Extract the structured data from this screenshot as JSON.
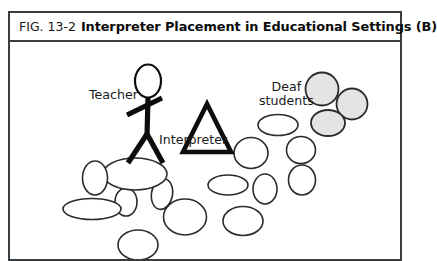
{
  "figure": {
    "number": "FIG. 13-2",
    "title": "Interpreter Placement in Educational Settings (B)",
    "frame_color": "#3a3d3f"
  },
  "diagram": {
    "labels": {
      "teacher": "Teacher",
      "interpreter": "Interpreter",
      "deaf_students_line1": "Deaf",
      "deaf_students_line2": "students"
    },
    "icons": {
      "teacher": "stick-figure-icon",
      "interpreter": "triangle-icon",
      "student": "ellipse-icon",
      "deaf_student": "shaded-circle-icon"
    },
    "colors": {
      "outline": "#2b2b2b",
      "student_fill": "#ffffff",
      "deaf_student_fill": "#e4e4e4",
      "figure_stroke": "#0d0d0d"
    },
    "shapes": {
      "teacher_figure": {
        "head_cx": 138,
        "head_cy": 39,
        "head_rx": 13,
        "head_ry": 16.5
      },
      "interpreter_triangle": {
        "apex_x": 197,
        "apex_y": 62,
        "left_x": 173,
        "right_y": 110,
        "right_x": 221
      },
      "deaf_students": [
        {
          "cx": 312,
          "cy": 47,
          "r": 16.5
        },
        {
          "cx": 342,
          "cy": 62,
          "r": 15.5
        },
        {
          "cx": 318,
          "cy": 81,
          "rx": 17,
          "ry": 13
        }
      ],
      "hearing_students": [
        {
          "cx": 268,
          "cy": 83,
          "rx": 20,
          "ry": 10.5,
          "rot": 0
        },
        {
          "cx": 241,
          "cy": 111,
          "rx": 17,
          "ry": 15.5,
          "rot": 0
        },
        {
          "cx": 291,
          "cy": 108,
          "rx": 14.5,
          "ry": 13.5,
          "rot": 0
        },
        {
          "cx": 292,
          "cy": 138,
          "rx": 13.5,
          "ry": 15,
          "rot": 0
        },
        {
          "cx": 255,
          "cy": 147,
          "rx": 12,
          "ry": 15,
          "rot": 0
        },
        {
          "cx": 218,
          "cy": 143,
          "rx": 20,
          "ry": 10,
          "rot": 0
        },
        {
          "cx": 233,
          "cy": 179,
          "rx": 20,
          "ry": 14.5,
          "rot": 0
        },
        {
          "cx": 175,
          "cy": 175,
          "rx": 21.5,
          "ry": 18,
          "rot": 0
        },
        {
          "cx": 152,
          "cy": 152,
          "rx": 10.5,
          "ry": 15.5,
          "rot": 10
        },
        {
          "cx": 116,
          "cy": 160,
          "rx": 11,
          "ry": 14,
          "rot": 0
        },
        {
          "cx": 125,
          "cy": 132,
          "rx": 32,
          "ry": 16,
          "rot": 0
        },
        {
          "cx": 85,
          "cy": 136,
          "rx": 12.5,
          "ry": 17,
          "rot": 0
        },
        {
          "cx": 82,
          "cy": 167,
          "rx": 29,
          "ry": 10.5,
          "rot": 0
        },
        {
          "cx": 128,
          "cy": 203,
          "rx": 20,
          "ry": 15,
          "rot": 0
        }
      ]
    }
  }
}
